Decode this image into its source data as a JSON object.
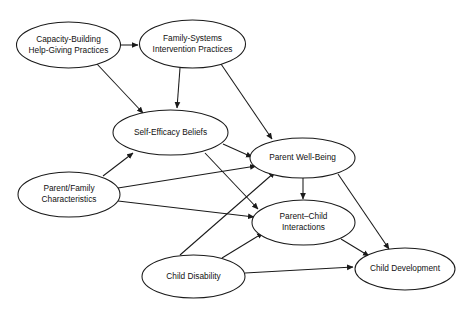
{
  "diagram": {
    "type": "path-model-diagram",
    "title": "",
    "background_color": "#ffffff",
    "line_color": "#1a1a1a",
    "text_color": "#111111",
    "nodes": [
      {
        "id": "capacity_building",
        "label_lines": [
          "Capacity-Building",
          "Help-Giving Practices"
        ],
        "cx": 68.5,
        "cy": 45,
        "rx": 52,
        "ry": 23
      },
      {
        "id": "family_systems",
        "label_lines": [
          "Family-Systems",
          "Intervention Practices"
        ],
        "cx": 192.5,
        "cy": 44,
        "rx": 53,
        "ry": 24
      },
      {
        "id": "self_efficacy",
        "label_lines": [
          "Self-Efficacy Beliefs"
        ],
        "cx": 170.5,
        "cy": 132.5,
        "rx": 57.5,
        "ry": 22.5
      },
      {
        "id": "parent_wellbeing",
        "label_lines": [
          "Parent Well-Being"
        ],
        "cx": 302.5,
        "cy": 158,
        "rx": 52.5,
        "ry": 20
      },
      {
        "id": "parent_family",
        "label_lines": [
          "Parent/Family",
          "Characteristics"
        ],
        "cx": 69,
        "cy": 194.5,
        "rx": 51,
        "ry": 22.5
      },
      {
        "id": "parent_child",
        "label_lines": [
          "Parent–Child",
          "Interactions"
        ],
        "cx": 303.5,
        "cy": 222.5,
        "rx": 51.5,
        "ry": 22.5
      },
      {
        "id": "child_disability",
        "label_lines": [
          "Child Disability"
        ],
        "cx": 193.5,
        "cy": 276.5,
        "rx": 51.5,
        "ry": 21.5
      },
      {
        "id": "child_development",
        "label_lines": [
          "Child Development"
        ],
        "cx": 405,
        "cy": 269,
        "rx": 50,
        "ry": 21
      }
    ],
    "edges": [
      {
        "id": "e1",
        "from": "capacity_building",
        "to": "family_systems",
        "x1": 121,
        "y1": 45,
        "x2": 138,
        "y2": 45
      },
      {
        "id": "e2",
        "from": "capacity_building",
        "to": "self_efficacy",
        "x1": 97,
        "y1": 64,
        "x2": 143,
        "y2": 113
      },
      {
        "id": "e3",
        "from": "family_systems",
        "to": "self_efficacy",
        "x1": 180,
        "y1": 68,
        "x2": 177,
        "y2": 108
      },
      {
        "id": "e4",
        "from": "family_systems",
        "to": "parent_wellbeing",
        "x1": 221,
        "y1": 64,
        "x2": 272,
        "y2": 139
      },
      {
        "id": "e5",
        "from": "self_efficacy",
        "to": "parent_wellbeing",
        "x1": 223,
        "y1": 144,
        "x2": 252,
        "y2": 157
      },
      {
        "id": "e6",
        "from": "self_efficacy",
        "to": "parent_child",
        "x1": 205,
        "y1": 153,
        "x2": 258,
        "y2": 209
      },
      {
        "id": "e7",
        "from": "parent_family",
        "to": "self_efficacy",
        "x1": 103,
        "y1": 176,
        "x2": 133,
        "y2": 153
      },
      {
        "id": "e8",
        "from": "parent_family",
        "to": "parent_wellbeing",
        "x1": 118,
        "y1": 188,
        "x2": 256,
        "y2": 166
      },
      {
        "id": "e9",
        "from": "parent_family",
        "to": "parent_child",
        "x1": 118,
        "y1": 201,
        "x2": 254,
        "y2": 217
      },
      {
        "id": "e10",
        "from": "parent_wellbeing",
        "to": "parent_child",
        "x1": 303,
        "y1": 178,
        "x2": 303,
        "y2": 199
      },
      {
        "id": "e11",
        "from": "parent_wellbeing",
        "to": "child_development",
        "x1": 338,
        "y1": 174,
        "x2": 389,
        "y2": 249
      },
      {
        "id": "e12",
        "from": "parent_child",
        "to": "child_development",
        "x1": 341,
        "y1": 239,
        "x2": 369,
        "y2": 256
      },
      {
        "id": "e13",
        "from": "child_disability",
        "to": "parent_wellbeing",
        "x1": 180,
        "y1": 255,
        "x2": 275,
        "y2": 172
      },
      {
        "id": "e14",
        "from": "child_disability",
        "to": "parent_child",
        "x1": 222,
        "y1": 258,
        "x2": 263,
        "y2": 233
      },
      {
        "id": "e15",
        "from": "child_disability",
        "to": "child_development",
        "x1": 245,
        "y1": 273,
        "x2": 353,
        "y2": 267
      }
    ]
  }
}
